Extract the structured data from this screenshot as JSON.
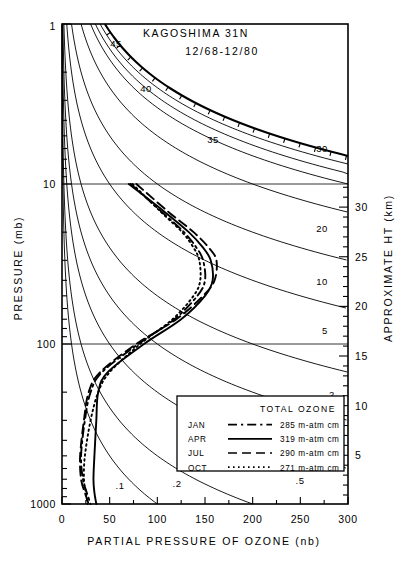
{
  "title": {
    "station": "KAGOSHIMA 31N",
    "period": "12/68-12/80"
  },
  "axes": {
    "x_label": "PARTIAL PRESSURE OF OZONE (nb)",
    "y_label": "PRESSURE (mb)",
    "y2_label": "APPROXIMATE HT (km)"
  },
  "legend": {
    "header": "TOTAL OZONE",
    "unit": "m-atm cm",
    "rows": [
      {
        "month": "JAN",
        "style": "dashdot",
        "value": "285",
        "unit": "m-atm cm"
      },
      {
        "month": "APR",
        "style": "solid",
        "value": "319",
        "unit": "m-atm cm"
      },
      {
        "month": "JUL",
        "style": "dashed",
        "value": "290",
        "unit": "m-atm cm"
      },
      {
        "month": "OCT",
        "style": "dotted",
        "value": "271",
        "unit": "m-atm cm"
      }
    ]
  },
  "chart_data": {
    "type": "line",
    "title": "KAGOSHIMA 31N 12/68-12/80",
    "xlabel": "PARTIAL PRESSURE OF OZONE (nb)",
    "ylabel": "PRESSURE (mb)",
    "y2label": "APPROXIMATE HT (km)",
    "xlim": [
      0,
      300
    ],
    "ylim": [
      1000,
      1
    ],
    "yscale": "log",
    "grid": false,
    "gridlines_drawn": [
      10,
      100
    ],
    "legend_position": "lower-right",
    "xticks": [
      0,
      50,
      100,
      150,
      200,
      250,
      300
    ],
    "yticks": [
      1,
      10,
      100,
      1000
    ],
    "y2ticks": [
      5,
      10,
      15,
      20,
      25,
      30
    ],
    "mixing_ratio_contours": {
      "note": "ozone mixing ratio labels (ppmv) drawn as curved contours",
      "labels": [
        "45",
        "40",
        "35",
        "30",
        "20",
        "10",
        "5",
        "2",
        "1",
        ".5",
        ".2",
        ".1"
      ]
    },
    "series": [
      {
        "name": "JAN",
        "style": "dashdot",
        "total_ozone": 285,
        "total_ozone_unit": "m-atm cm",
        "points": [
          {
            "p": 10,
            "o3": 72
          },
          {
            "p": 15,
            "o3": 105
          },
          {
            "p": 20,
            "o3": 128
          },
          {
            "p": 25,
            "o3": 141
          },
          {
            "p": 30,
            "o3": 148
          },
          {
            "p": 40,
            "o3": 150
          },
          {
            "p": 50,
            "o3": 142
          },
          {
            "p": 70,
            "o3": 118
          },
          {
            "p": 100,
            "o3": 80
          },
          {
            "p": 150,
            "o3": 42
          },
          {
            "p": 200,
            "o3": 30
          },
          {
            "p": 300,
            "o3": 24
          },
          {
            "p": 500,
            "o3": 20
          },
          {
            "p": 700,
            "o3": 22
          },
          {
            "p": 850,
            "o3": 26
          },
          {
            "p": 1000,
            "o3": 30
          }
        ]
      },
      {
        "name": "APR",
        "style": "solid",
        "total_ozone": 319,
        "total_ozone_unit": "m-atm cm",
        "points": [
          {
            "p": 10,
            "o3": 70
          },
          {
            "p": 15,
            "o3": 108
          },
          {
            "p": 20,
            "o3": 133
          },
          {
            "p": 25,
            "o3": 148
          },
          {
            "p": 30,
            "o3": 156
          },
          {
            "p": 40,
            "o3": 158
          },
          {
            "p": 50,
            "o3": 150
          },
          {
            "p": 70,
            "o3": 125
          },
          {
            "p": 100,
            "o3": 86
          },
          {
            "p": 150,
            "o3": 48
          },
          {
            "p": 200,
            "o3": 38
          },
          {
            "p": 300,
            "o3": 36
          },
          {
            "p": 500,
            "o3": 34
          },
          {
            "p": 700,
            "o3": 33
          },
          {
            "p": 850,
            "o3": 34
          },
          {
            "p": 1000,
            "o3": 36
          }
        ]
      },
      {
        "name": "JUL",
        "style": "dashed",
        "total_ozone": 290,
        "total_ozone_unit": "m-atm cm",
        "points": [
          {
            "p": 10,
            "o3": 78
          },
          {
            "p": 15,
            "o3": 112
          },
          {
            "p": 20,
            "o3": 138
          },
          {
            "p": 25,
            "o3": 154
          },
          {
            "p": 30,
            "o3": 162
          },
          {
            "p": 40,
            "o3": 160
          },
          {
            "p": 50,
            "o3": 148
          },
          {
            "p": 70,
            "o3": 120
          },
          {
            "p": 100,
            "o3": 78
          },
          {
            "p": 150,
            "o3": 40
          },
          {
            "p": 200,
            "o3": 28
          },
          {
            "p": 300,
            "o3": 23
          },
          {
            "p": 500,
            "o3": 19
          },
          {
            "p": 700,
            "o3": 20
          },
          {
            "p": 850,
            "o3": 24
          },
          {
            "p": 1000,
            "o3": 28
          }
        ]
      },
      {
        "name": "OCT",
        "style": "dotted",
        "total_ozone": 271,
        "total_ozone_unit": "m-atm cm",
        "points": [
          {
            "p": 10,
            "o3": 74
          },
          {
            "p": 15,
            "o3": 104
          },
          {
            "p": 20,
            "o3": 126
          },
          {
            "p": 25,
            "o3": 138
          },
          {
            "p": 30,
            "o3": 144
          },
          {
            "p": 40,
            "o3": 145
          },
          {
            "p": 50,
            "o3": 138
          },
          {
            "p": 70,
            "o3": 116
          },
          {
            "p": 100,
            "o3": 82
          },
          {
            "p": 150,
            "o3": 50
          },
          {
            "p": 200,
            "o3": 38
          },
          {
            "p": 300,
            "o3": 30
          },
          {
            "p": 500,
            "o3": 24
          },
          {
            "p": 700,
            "o3": 23
          },
          {
            "p": 850,
            "o3": 25
          },
          {
            "p": 1000,
            "o3": 27
          }
        ]
      }
    ]
  }
}
